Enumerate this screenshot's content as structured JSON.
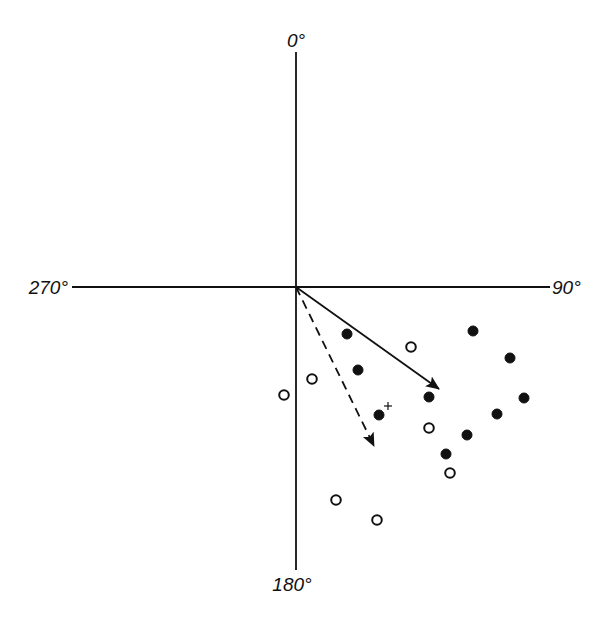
{
  "diagram": {
    "type": "circular-vector-plot",
    "origin": {
      "x": 296,
      "y": 287
    },
    "axes": {
      "top_label": "0°",
      "right_label": "90°",
      "bottom_label": "180°",
      "left_label": "270°",
      "vertical": {
        "x": 296,
        "y1": 52,
        "y2": 570
      },
      "horizontal": {
        "y": 287,
        "x1": 72,
        "x2": 550
      }
    },
    "vectors": [
      {
        "name": "solid-mean-vector",
        "style": "solid",
        "tip": {
          "x": 439,
          "y": 389
        }
      },
      {
        "name": "dashed-mean-vector",
        "style": "dashed",
        "tip": {
          "x": 374,
          "y": 446
        }
      }
    ],
    "filled_points": [
      {
        "x": 347,
        "y": 334
      },
      {
        "x": 358,
        "y": 370
      },
      {
        "x": 379,
        "y": 415
      },
      {
        "x": 429,
        "y": 397
      },
      {
        "x": 473,
        "y": 331
      },
      {
        "x": 510,
        "y": 358
      },
      {
        "x": 524,
        "y": 398
      },
      {
        "x": 497,
        "y": 414
      },
      {
        "x": 467,
        "y": 435
      },
      {
        "x": 446,
        "y": 454
      }
    ],
    "open_points": [
      {
        "x": 411,
        "y": 347
      },
      {
        "x": 312,
        "y": 379
      },
      {
        "x": 284,
        "y": 395
      },
      {
        "x": 429,
        "y": 428
      },
      {
        "x": 450,
        "y": 473
      },
      {
        "x": 336,
        "y": 500
      },
      {
        "x": 377,
        "y": 520
      }
    ],
    "markers": [
      {
        "symbol": "+",
        "x": 388,
        "y": 406
      }
    ],
    "colors": {
      "ink": "#111111",
      "background": "#ffffff"
    }
  }
}
